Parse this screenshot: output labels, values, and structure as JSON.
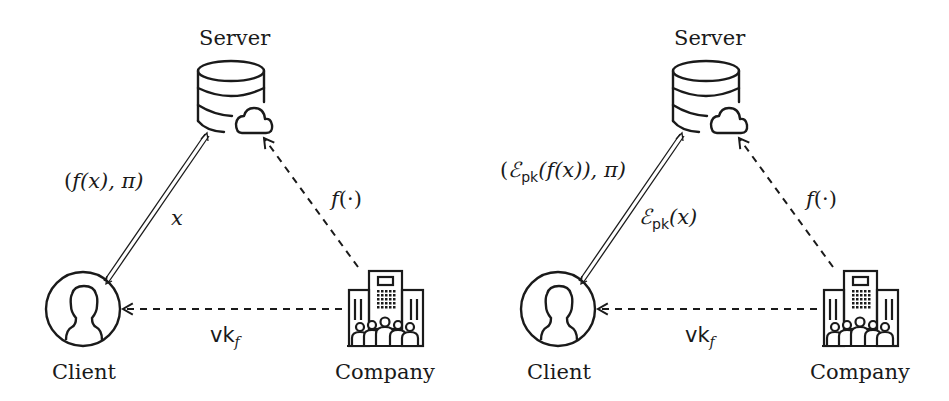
{
  "diagrams": [
    {
      "id": "plain",
      "nodes": {
        "server": {
          "label": "Server",
          "icon": "database-cloud-icon"
        },
        "client": {
          "label": "Client",
          "icon": "user-circle-icon"
        },
        "company": {
          "label": "Company",
          "icon": "office-building-people-icon"
        }
      },
      "edges": {
        "client_server": {
          "style": "double-line",
          "direction": "both",
          "label_to_client": "(f(x), π)",
          "label_to_server": "x"
        },
        "company_server": {
          "style": "dashed",
          "direction": "company-to-server",
          "label": "f(·)"
        },
        "company_client": {
          "style": "dashed",
          "direction": "company-to-client",
          "label": "vk_f"
        }
      },
      "label_parts": {
        "resp_open": "(",
        "resp_f": "f",
        "resp_x": "(x)",
        "resp_close": ", π)",
        "req": "x",
        "func_f": "f",
        "func_rest": "(·)",
        "vk_main": "vk",
        "vk_sub": "f"
      }
    },
    {
      "id": "encrypted",
      "nodes": {
        "server": {
          "label": "Server",
          "icon": "database-cloud-icon"
        },
        "client": {
          "label": "Client",
          "icon": "user-circle-icon"
        },
        "company": {
          "label": "Company",
          "icon": "office-building-people-icon"
        }
      },
      "edges": {
        "client_server": {
          "style": "double-line",
          "direction": "both",
          "label_to_client": "(E_pk(f(x)), π)",
          "label_to_server": "E_pk(x)"
        },
        "company_server": {
          "style": "dashed",
          "direction": "company-to-server",
          "label": "f(·)"
        },
        "company_client": {
          "style": "dashed",
          "direction": "company-to-client",
          "label": "vk_f"
        }
      },
      "label_parts": {
        "resp_open": "(",
        "resp_E": "ℰ",
        "resp_pk": "pk",
        "resp_inner": "(f(x)), π)",
        "req_E": "ℰ",
        "req_pk": "pk",
        "req_rest": "(x)",
        "func_f": "f",
        "func_rest": "(·)",
        "vk_main": "vk",
        "vk_sub": "f"
      }
    }
  ],
  "colors": {
    "stroke": "#1a1a1a",
    "background": "#ffffff"
  }
}
